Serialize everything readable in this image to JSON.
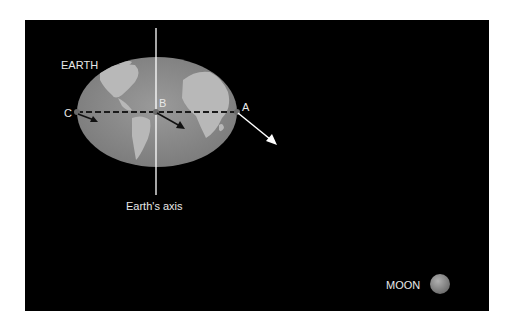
{
  "diagram": {
    "labels": {
      "earth": "EARTH",
      "point_a": "A",
      "point_b": "B",
      "point_c": "C",
      "axis": "Earth's axis",
      "moon": "MOON"
    },
    "colors": {
      "background": "#000000",
      "earth_ocean": "#8a8a8a",
      "earth_land": "#b4b4b4",
      "dashed_line": "#222222",
      "arrow_outside": "#ffffff",
      "arrow_inside": "#111111",
      "moon": "#8c8c8c"
    }
  }
}
